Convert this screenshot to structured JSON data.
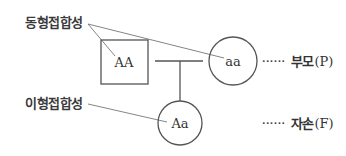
{
  "diagram": {
    "annotations": {
      "homozygous": "동형접합성",
      "heterozygous": "이형접합성"
    },
    "nodes": {
      "parent_square": {
        "shape": "square",
        "genotype": "AA"
      },
      "parent_circle": {
        "shape": "circle",
        "genotype": "aa"
      },
      "offspring_circle": {
        "shape": "circle",
        "genotype": "Aa"
      }
    },
    "generations": {
      "parent": {
        "dots": "······",
        "name": "부모",
        "code": "(P)"
      },
      "offspring": {
        "dots": "······",
        "name": "자손",
        "code": "(F)"
      }
    },
    "colors": {
      "line": "#555555",
      "text": "#333333",
      "background": "#ffffff"
    }
  }
}
